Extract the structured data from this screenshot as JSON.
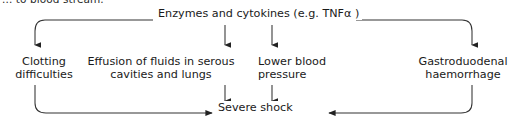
{
  "diagram": {
    "type": "flowchart",
    "clipped_caption": "... to blood stream.",
    "line_color": "#333333",
    "text_color": "#1a1a1a",
    "background": "#ffffff",
    "nodes": [
      {
        "id": "source",
        "label": "Enzymes and cytokines (e.g. TNFα )"
      },
      {
        "id": "clotting",
        "label": "Clotting\ndifficulties"
      },
      {
        "id": "effusion",
        "label": "Effusion of fluids in serous\ncavities and lungs"
      },
      {
        "id": "pressure",
        "label": "Lower blood\npressure"
      },
      {
        "id": "haemorrhage",
        "label": "Gastroduodenal\nhaemorrhage"
      },
      {
        "id": "shock",
        "label": "Severe shock"
      }
    ],
    "edges": [
      {
        "from": "source",
        "to": "clotting",
        "style": "elbow-left"
      },
      {
        "from": "source",
        "to": "effusion",
        "style": "straight-down"
      },
      {
        "from": "source",
        "to": "pressure",
        "style": "straight-down"
      },
      {
        "from": "source",
        "to": "haemorrhage",
        "style": "elbow-right"
      },
      {
        "from": "clotting",
        "to": "shock",
        "style": "elbow-bottom-left"
      },
      {
        "from": "effusion",
        "to": "shock",
        "style": "straight-down"
      },
      {
        "from": "pressure",
        "to": "shock",
        "style": "straight-down"
      },
      {
        "from": "haemorrhage",
        "to": "shock",
        "style": "elbow-bottom-right"
      }
    ]
  }
}
